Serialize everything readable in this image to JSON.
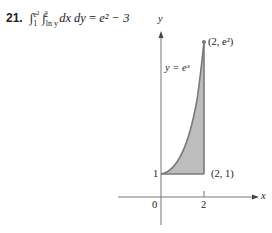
{
  "problem": {
    "number": "21.",
    "outer_integral": "∫",
    "outer_lower": "1",
    "outer_upper": "e²",
    "inner_integral": "∫",
    "inner_lower": "ln y",
    "inner_upper": "2",
    "integrand": "dx dy",
    "equals": "=",
    "result": "e² − 3"
  },
  "figure": {
    "y_axis_label": "y",
    "x_axis_label": "x",
    "curve_label": "y = eˣ",
    "point_top_label": "(2, e²)",
    "point_bottom_label": "(2, 1)",
    "origin_label": "0",
    "x_tick_label": "2",
    "y_tick_label": "1",
    "region_fill": "#bdbdbd",
    "curve_color": "#7a7a7a"
  }
}
